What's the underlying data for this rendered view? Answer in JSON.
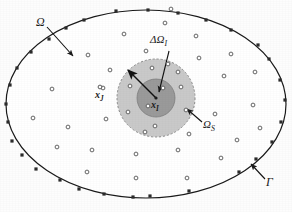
{
  "figure": {
    "type": "diagram",
    "canvas": {
      "width": 292,
      "height": 212,
      "background": "#fdfdfd"
    }
  },
  "colors": {
    "line": "#1a1a1a",
    "support_domain_fill": "#c9c9c9",
    "local_subdomain_fill": "#9a9a9a",
    "node_stroke": "#555555",
    "node_fill": "#ffffff",
    "boundary_node_fill": "#2b2b2b",
    "background": "#fdfdfd"
  },
  "labels": {
    "domain": {
      "text": "Ω",
      "sub": "",
      "x": 40,
      "y": 22
    },
    "boundary": {
      "text": "Γ",
      "sub": "",
      "x": 264,
      "y": 182
    },
    "local_subdomain": {
      "text": "ΔΩ",
      "sub": "I",
      "x": 158,
      "y": 42
    },
    "support_domain": {
      "text": "Ω",
      "sub": "S",
      "x": 200,
      "y": 118
    },
    "node_xI": {
      "text": "x",
      "sub": "I",
      "x": 154,
      "y": 103
    },
    "node_xJ": {
      "text": "x",
      "sub": "J",
      "x": 98,
      "y": 94
    }
  },
  "geometry": {
    "outer_ellipse": {
      "cx": 146,
      "cy": 104,
      "rx": 140,
      "ry": 94,
      "stroke_width": 1.2
    },
    "support_circle": {
      "cx": 156,
      "cy": 98,
      "r": 39,
      "dashed": true
    },
    "local_circle": {
      "cx": 156,
      "cy": 98,
      "r": 19,
      "dashed": false
    },
    "radius_arrow": {
      "x1": 156,
      "y1": 98,
      "x2": 128,
      "y2": 70
    },
    "domain_arrow": {
      "x1": 48,
      "y1": 28,
      "x2": 72,
      "y2": 54
    },
    "boundary_arrow": {
      "x1": 266,
      "y1": 178,
      "x2": 252,
      "y2": 163
    },
    "subdomain_arrow": {
      "x1": 168,
      "y1": 50,
      "x2": 160,
      "y2": 90
    }
  },
  "nodes": {
    "legend": {
      "interior_label": "field node",
      "boundary_label": "boundary node"
    },
    "boundary": [
      {
        "x": 116,
        "y": 11
      },
      {
        "x": 178,
        "y": 13
      },
      {
        "x": 231,
        "y": 30
      },
      {
        "x": 269,
        "y": 59
      },
      {
        "x": 285,
        "y": 100
      },
      {
        "x": 272,
        "y": 142
      },
      {
        "x": 239,
        "y": 172
      },
      {
        "x": 189,
        "y": 191
      },
      {
        "x": 133,
        "y": 197
      },
      {
        "x": 79,
        "y": 189
      },
      {
        "x": 36,
        "y": 169
      },
      {
        "x": 12,
        "y": 141
      },
      {
        "x": 6,
        "y": 104
      },
      {
        "x": 17,
        "y": 68
      },
      {
        "x": 49,
        "y": 39
      },
      {
        "x": 84,
        "y": 20
      },
      {
        "x": 206,
        "y": 20
      },
      {
        "x": 258,
        "y": 45
      },
      {
        "x": 150,
        "y": 196
      },
      {
        "x": 104,
        "y": 194
      },
      {
        "x": 60,
        "y": 180
      },
      {
        "x": 22,
        "y": 155
      },
      {
        "x": 8,
        "y": 122
      },
      {
        "x": 10,
        "y": 85
      },
      {
        "x": 31,
        "y": 52
      },
      {
        "x": 66,
        "y": 28
      },
      {
        "x": 148,
        "y": 10
      },
      {
        "x": 280,
        "y": 80
      },
      {
        "x": 281,
        "y": 122
      },
      {
        "x": 256,
        "y": 159
      }
    ],
    "interior": [
      {
        "x": 165,
        "y": 23
      },
      {
        "x": 124,
        "y": 34
      },
      {
        "x": 196,
        "y": 36
      },
      {
        "x": 88,
        "y": 55
      },
      {
        "x": 146,
        "y": 51
      },
      {
        "x": 231,
        "y": 54
      },
      {
        "x": 199,
        "y": 58
      },
      {
        "x": 52,
        "y": 89
      },
      {
        "x": 103,
        "y": 88
      },
      {
        "x": 224,
        "y": 76
      },
      {
        "x": 255,
        "y": 72
      },
      {
        "x": 253,
        "y": 105
      },
      {
        "x": 215,
        "y": 114
      },
      {
        "x": 106,
        "y": 119
      },
      {
        "x": 68,
        "y": 127
      },
      {
        "x": 145,
        "y": 132
      },
      {
        "x": 189,
        "y": 134
      },
      {
        "x": 237,
        "y": 140
      },
      {
        "x": 92,
        "y": 150
      },
      {
        "x": 136,
        "y": 154
      },
      {
        "x": 178,
        "y": 150
      },
      {
        "x": 221,
        "y": 158
      },
      {
        "x": 57,
        "y": 147
      },
      {
        "x": 136,
        "y": 178
      },
      {
        "x": 187,
        "y": 178
      },
      {
        "x": 87,
        "y": 172
      },
      {
        "x": 33,
        "y": 118
      },
      {
        "x": 260,
        "y": 128
      },
      {
        "x": 110,
        "y": 70
      },
      {
        "x": 171,
        "y": 9
      }
    ],
    "in_support": [
      {
        "x": 152,
        "y": 68
      },
      {
        "x": 130,
        "y": 86
      },
      {
        "x": 181,
        "y": 87
      },
      {
        "x": 186,
        "y": 110
      },
      {
        "x": 128,
        "y": 112
      },
      {
        "x": 155,
        "y": 126
      },
      {
        "x": 168,
        "y": 64
      },
      {
        "x": 178,
        "y": 72
      }
    ],
    "in_local": [
      {
        "x": 163,
        "y": 88
      },
      {
        "x": 148,
        "y": 106
      }
    ]
  }
}
